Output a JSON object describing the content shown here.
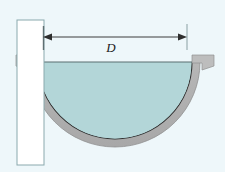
{
  "figure": {
    "name": "hemispherical-tank-cross-section",
    "caption": "",
    "background_color": "#eef7fa"
  },
  "dimension": {
    "label": "D",
    "label_style": "italic-serif",
    "line_color": "#3c3c3c",
    "orientation": "horizontal",
    "arrowheads": "both-ends",
    "x_start": 43,
    "x_end": 187,
    "y": 37,
    "tick_top": 25,
    "tick_bottom": 50,
    "label_x": 111,
    "label_y": 52
  },
  "wall": {
    "name": "vertical-support-wall",
    "fill_color": "#ffffff",
    "stroke_color": "#8aa9ad",
    "x": 17,
    "y": 20,
    "width": 27,
    "height": 145
  },
  "tank": {
    "name": "hemispherical-tank",
    "shell_color": "#b8b8b8",
    "shell_highlight_color": "#cfcfcf",
    "inner_outline_color": "#2e2e2e",
    "outer_outline_color": "#8f8f8f",
    "center_x": 115,
    "center_y": 62,
    "outer_radius": 85,
    "inner_radius": 77,
    "rim_y": 62
  },
  "rim_left": {
    "name": "tank-rim-flange-left",
    "x": 16,
    "y": 55,
    "width": 22,
    "height": 8
  },
  "rim_right": {
    "name": "tank-rim-flange-right",
    "x": 192,
    "y": 55,
    "width": 22,
    "height": 8
  },
  "fluid": {
    "name": "liquid-body",
    "fill_color": "#b3d6d8",
    "surface_color": "#5a6e70",
    "surface_y": 62,
    "surface_x_start": 38,
    "surface_x_end": 192
  },
  "colors": {
    "background": "#eef7fa",
    "fluid": "#b3d6d8",
    "shell_gray": "#b8b8b8",
    "outline_dark": "#2e2e2e",
    "wall_stroke": "#8aa9ad",
    "dimension": "#3c3c3c"
  }
}
